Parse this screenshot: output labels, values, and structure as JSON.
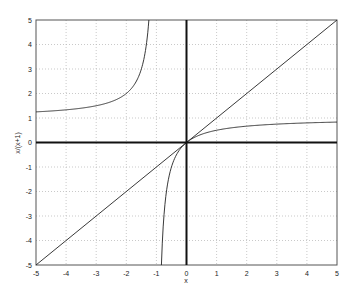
{
  "chart_data": {
    "type": "line",
    "title": "",
    "xlabel": "x",
    "ylabel": "x/(x+1)",
    "xlim": [
      -5,
      5
    ],
    "ylim": [
      -5,
      5
    ],
    "grid": true,
    "xticks": [
      -5,
      -4,
      -3,
      -2,
      -1,
      0,
      1,
      2,
      3,
      4,
      5
    ],
    "yticks": [
      -5,
      -4,
      -3,
      -2,
      -1,
      0,
      1,
      2,
      3,
      4,
      5
    ],
    "series": [
      {
        "name": "x/(x+1) left branch",
        "x": [
          -5,
          -4,
          -3,
          -2,
          -1.5,
          -1.25
        ],
        "y": [
          1.25,
          1.333,
          1.5,
          2,
          3,
          5
        ]
      },
      {
        "name": "x/(x+1) right branch",
        "x": [
          -0.833,
          -0.75,
          -0.5,
          0,
          1,
          2,
          3,
          4,
          5
        ],
        "y": [
          -5,
          -3,
          -1,
          0,
          0.5,
          0.667,
          0.75,
          0.8,
          0.833
        ]
      },
      {
        "name": "y = x",
        "x": [
          -5,
          5
        ],
        "y": [
          -5,
          5
        ]
      },
      {
        "name": "x-axis (y=0)",
        "x": [
          -5,
          5
        ],
        "y": [
          0,
          0
        ]
      },
      {
        "name": "y-axis (x=0)",
        "x": [
          0,
          0
        ],
        "y": [
          -5,
          5
        ]
      }
    ],
    "legend": null
  }
}
